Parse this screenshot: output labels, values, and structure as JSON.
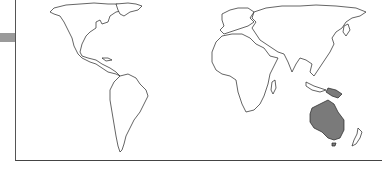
{
  "map": {
    "projection": "equal-area world map",
    "highlight_color": "#7a7a7a",
    "land_fill": "#ffffff",
    "outline_color": "#222222",
    "highlighted_regions": [
      "Australia",
      "Papua New Guinea"
    ],
    "regions": [
      "North America",
      "South America",
      "Europe",
      "Africa",
      "Asia",
      "Australia",
      "Papua New Guinea",
      "New Zealand",
      "Greenland",
      "Madagascar",
      "Japan",
      "Indonesia"
    ]
  },
  "frame": {
    "tab_color": "#9a9a9a",
    "border_color": "#555555"
  }
}
